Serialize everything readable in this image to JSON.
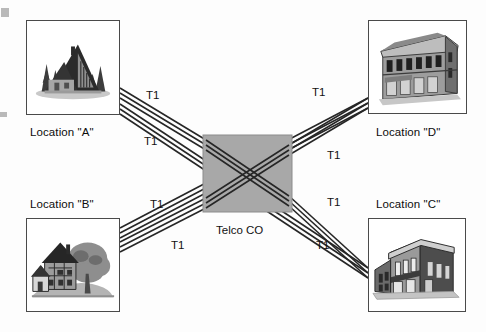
{
  "figure": {
    "type": "network-topology-diagram",
    "background_color": "#fdfdfd",
    "line_color": "#262626",
    "hub_fill": "#a8a8a8",
    "box_border": "#4a4a4a"
  },
  "hub": {
    "label": "Telco CO",
    "x": 203,
    "y": 135,
    "width": 89,
    "height": 77,
    "label_x": 243,
    "label_y": 231
  },
  "locations": [
    {
      "id": "a",
      "label": "Location \"A\"",
      "icon": "house-a-frame-building",
      "box_x": 26,
      "box_y": 20,
      "box_w": 94,
      "box_h": 95,
      "label_x": 73,
      "label_y": 133,
      "label_position": "below"
    },
    {
      "id": "d",
      "label": "Location \"D\"",
      "icon": "classical-office-building",
      "box_x": 368,
      "box_y": 20,
      "box_w": 99,
      "box_h": 94,
      "label_x": 418,
      "label_y": 133,
      "label_position": "below"
    },
    {
      "id": "b",
      "label": "Location \"B\"",
      "icon": "cottage-with-tree",
      "box_x": 26,
      "box_y": 218,
      "box_w": 94,
      "box_h": 94,
      "label_x": 73,
      "label_y": 205,
      "label_position": "above"
    },
    {
      "id": "c",
      "label": "Location \"C\"",
      "icon": "commercial-storefront-building",
      "box_x": 368,
      "box_y": 218,
      "box_w": 98,
      "box_h": 94,
      "label_x": 418,
      "label_y": 205,
      "label_position": "above"
    }
  ],
  "links": [
    {
      "id": "a-hub",
      "from": "a",
      "to": "hub",
      "label": "T1",
      "label_x": 153,
      "label_y": 97,
      "conductors": 3
    },
    {
      "id": "b-hub",
      "from": "b",
      "to": "hub",
      "label": "T1",
      "label_x": 157,
      "label_y": 206,
      "conductors": 3
    },
    {
      "id": "hub-d",
      "from": "hub",
      "to": "d",
      "label": "T1",
      "label_x": 319,
      "label_y": 94,
      "conductors": 3
    },
    {
      "id": "hub-c",
      "from": "hub",
      "to": "c",
      "label": "T1",
      "label_x": 334,
      "label_y": 204,
      "conductors": 3
    },
    {
      "id": "a-c",
      "from": "a",
      "to": "c",
      "label": "T1",
      "label_x": 151,
      "label_y": 143,
      "conductors": 3
    },
    {
      "id": "a-c-2",
      "from": "a",
      "to": "c",
      "label": "T1",
      "label_x": 323,
      "label_y": 247,
      "conductors": 3
    },
    {
      "id": "b-d",
      "from": "b",
      "to": "d",
      "label": "T1",
      "label_x": 178,
      "label_y": 247,
      "conductors": 3
    },
    {
      "id": "b-d-2",
      "from": "b",
      "to": "d",
      "label": "T1",
      "label_x": 334,
      "label_y": 157,
      "conductors": 3
    }
  ],
  "t1_labels": [
    {
      "text": "T1",
      "x": 153,
      "y": 97
    },
    {
      "text": "T1",
      "x": 151,
      "y": 143
    },
    {
      "text": "T1",
      "x": 319,
      "y": 94
    },
    {
      "text": "T1",
      "x": 334,
      "y": 157
    },
    {
      "text": "T1",
      "x": 157,
      "y": 206
    },
    {
      "text": "T1",
      "x": 178,
      "y": 247
    },
    {
      "text": "T1",
      "x": 334,
      "y": 204
    },
    {
      "text": "T1",
      "x": 323,
      "y": 247
    }
  ],
  "scan_artifacts": [
    {
      "x": 1,
      "y": 8,
      "w": 8,
      "h": 9
    },
    {
      "x": 0,
      "y": 112,
      "w": 7,
      "h": 5
    }
  ]
}
